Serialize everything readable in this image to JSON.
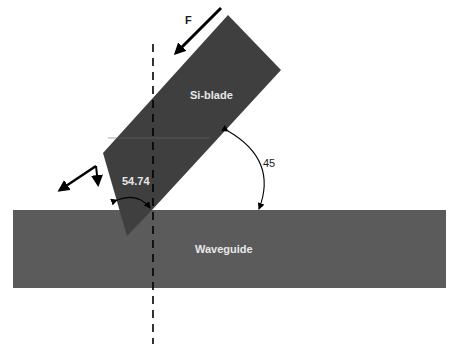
{
  "diagram": {
    "labels": {
      "force": "F",
      "blade": "Si-blade",
      "waveguide": "Waveguide",
      "angle_blade_tip": "54.74",
      "angle_blade_incline": "45"
    },
    "colors": {
      "blade_fill": "#3f3f3f",
      "waveguide_fill": "#5b5b5b",
      "label_on_dark": "#e8e8e8",
      "label_on_light": "#1a1a1a",
      "arrow": "#000000"
    },
    "angles_deg": {
      "blade_tip": 54.74,
      "blade_incline": 45
    }
  }
}
